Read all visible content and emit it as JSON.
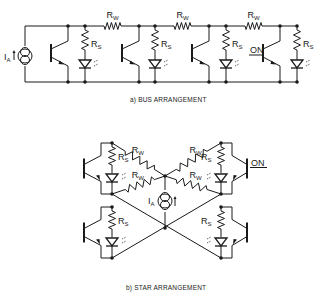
{
  "bus": {
    "caption": "a)  BUS ARRANGEMENT",
    "source_label": "I",
    "source_sub": "A",
    "rs_label": "R",
    "rs_sub": "S",
    "rw_label": "R",
    "rw_sub": "W",
    "on_label": "ON",
    "cells": 4,
    "active_cell": 4
  },
  "star": {
    "caption": "b)  STAR ARRANGEMENT",
    "source_label": "I",
    "source_sub": "A",
    "rs_label": "R",
    "rs_sub": "S",
    "rw_label": "R",
    "rw_sub": "W",
    "on_label": "ON",
    "cells": 4,
    "active_cell": "top-right"
  }
}
